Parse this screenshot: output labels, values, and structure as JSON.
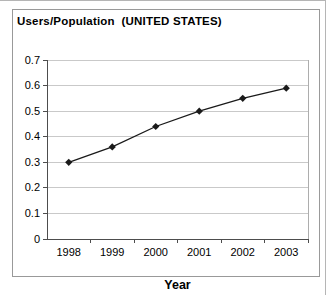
{
  "frame": {
    "border_color": "#999999",
    "background": "#ffffff"
  },
  "page_edge_color": "#b5b5b5",
  "chart_data": {
    "type": "line",
    "title": "Users/Population  (UNITED STATES)",
    "xlabel": "Year",
    "ylabel": "",
    "categories": [
      "1998",
      "1999",
      "2000",
      "2001",
      "2002",
      "2003"
    ],
    "series": [
      {
        "name": "Users/Population",
        "values": [
          0.3,
          0.36,
          0.44,
          0.5,
          0.55,
          0.59
        ],
        "color": "#1a1a1a",
        "marker": "diamond"
      }
    ],
    "ylim": [
      0,
      0.7
    ],
    "ytick_step": 0.1,
    "ytick_labels": [
      "0",
      "0.1",
      "0.2",
      "0.3",
      "0.4",
      "0.5",
      "0.6",
      "0.7"
    ],
    "grid": true,
    "legend_position": "none",
    "colors": {
      "gridline": "#c9c9c9",
      "axis": "#4d4d4d",
      "plot_border": "#adadad",
      "text": "#000000"
    }
  }
}
